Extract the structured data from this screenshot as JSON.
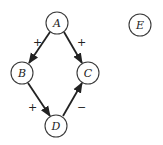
{
  "diagram": {
    "type": "signed-directed-graph",
    "nodes": [
      {
        "id": "A",
        "label": "A",
        "x": 57,
        "y": 23
      },
      {
        "id": "B",
        "label": "B",
        "x": 22,
        "y": 73
      },
      {
        "id": "C",
        "label": "C",
        "x": 88,
        "y": 73
      },
      {
        "id": "D",
        "label": "D",
        "x": 56,
        "y": 126
      },
      {
        "id": "E",
        "label": "E",
        "x": 140,
        "y": 25
      }
    ],
    "edges": [
      {
        "from": "A",
        "to": "B",
        "sign": "+"
      },
      {
        "from": "A",
        "to": "C",
        "sign": "+"
      },
      {
        "from": "B",
        "to": "D",
        "sign": "+"
      },
      {
        "from": "D",
        "to": "C",
        "sign": "−"
      }
    ]
  }
}
